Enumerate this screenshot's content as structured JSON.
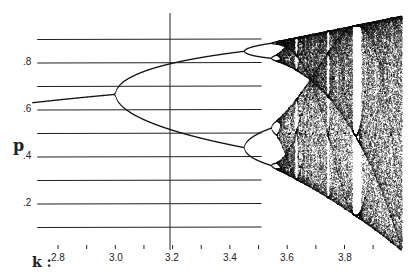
{
  "chart_data": {
    "type": "scatter",
    "title": "",
    "subtitle": "Bifurcation diagram of the logistic map",
    "xlabel": "k",
    "ylabel": "p",
    "xlim": [
      2.7,
      4.0
    ],
    "ylim": [
      0,
      1
    ],
    "x_ticks": [
      2.8,
      2.9,
      3.0,
      3.1,
      3.2,
      3.3,
      3.4,
      3.5,
      3.6,
      3.7,
      3.8,
      3.9
    ],
    "x_tick_labels": [
      "2.8",
      "3.0",
      "3.2",
      "3.4",
      "3.6",
      "3.8"
    ],
    "y_tick_labels": [
      ".2",
      ".4",
      ".6",
      ".8"
    ],
    "grid": {
      "horizontal_lines": [
        0.1,
        0.2,
        0.3,
        0.4,
        0.5,
        0.6,
        0.7,
        0.8,
        0.9
      ],
      "extent_x": [
        2.71,
        3.5
      ]
    },
    "reference_line": {
      "x": 3.2,
      "orientation": "vertical"
    },
    "annotations": [
      {
        "k": 3.0,
        "text": "period-doubling onset"
      },
      {
        "k": 3.45,
        "text": "period-4 bifurcation"
      },
      {
        "k": 3.57,
        "text": "onset of chaos"
      },
      {
        "k": 3.83,
        "text": "period-3 window"
      }
    ],
    "series": [
      {
        "name": "fixed point",
        "x": [
          2.71,
          2.8,
          2.9,
          3.0
        ],
        "y": [
          0.631,
          0.643,
          0.655,
          0.667
        ]
      },
      {
        "name": "period-2 upper",
        "x": [
          3.0,
          3.1,
          3.2,
          3.3,
          3.4,
          3.449
        ],
        "y": [
          0.667,
          0.765,
          0.799,
          0.824,
          0.842,
          0.849
        ]
      },
      {
        "name": "period-2 lower",
        "x": [
          3.0,
          3.1,
          3.2,
          3.3,
          3.4,
          3.449
        ],
        "y": [
          0.667,
          0.558,
          0.513,
          0.48,
          0.452,
          0.44
        ]
      }
    ]
  },
  "labels": {
    "y_axis_name": "p",
    "x_axis_name": "k :",
    "y_ticks": [
      {
        "text": ".8",
        "y": 63
      },
      {
        "text": ".6",
        "y": 110
      },
      {
        "text": ".4",
        "y": 157
      },
      {
        "text": ".2",
        "y": 204
      }
    ],
    "x_ticks": [
      {
        "text": "2.8",
        "x": 58
      },
      {
        "text": "3.0",
        "x": 116
      },
      {
        "text": "3.2",
        "x": 172
      },
      {
        "text": "3.4",
        "x": 230
      },
      {
        "text": "3.6",
        "x": 287
      },
      {
        "text": "3.8",
        "x": 345
      }
    ]
  }
}
